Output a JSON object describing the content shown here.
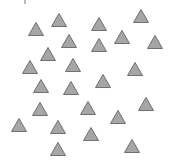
{
  "canvas": {
    "width": 171,
    "height": 161,
    "background": "#ffffff"
  },
  "shape_style": {
    "fill": "#a6a6a6",
    "stroke": "#6f6f6f",
    "size": 15
  },
  "triangles": [
    {
      "x": 36,
      "y": 29
    },
    {
      "x": 59,
      "y": 20
    },
    {
      "x": 99,
      "y": 24
    },
    {
      "x": 141,
      "y": 16
    },
    {
      "x": 69,
      "y": 41
    },
    {
      "x": 122,
      "y": 37
    },
    {
      "x": 155,
      "y": 42
    },
    {
      "x": 99,
      "y": 45
    },
    {
      "x": 48,
      "y": 54
    },
    {
      "x": 30,
      "y": 67
    },
    {
      "x": 73,
      "y": 65
    },
    {
      "x": 135,
      "y": 69
    },
    {
      "x": 41,
      "y": 86
    },
    {
      "x": 103,
      "y": 81
    },
    {
      "x": 71,
      "y": 88
    },
    {
      "x": 40,
      "y": 109
    },
    {
      "x": 88,
      "y": 108
    },
    {
      "x": 146,
      "y": 104
    },
    {
      "x": 118,
      "y": 117
    },
    {
      "x": 19,
      "y": 125
    },
    {
      "x": 58,
      "y": 127
    },
    {
      "x": 91,
      "y": 134
    },
    {
      "x": 58,
      "y": 149
    },
    {
      "x": 132,
      "y": 146
    }
  ]
}
